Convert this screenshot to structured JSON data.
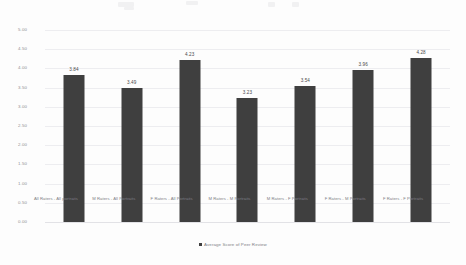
{
  "chart_data": {
    "type": "bar",
    "title": "",
    "xlabel": "",
    "ylabel": "",
    "ylim": [
      0,
      5
    ],
    "ytick_step": 0.5,
    "grid": true,
    "legend_position": "bottom",
    "bar_color": "#3f3f3f",
    "categories": [
      "All Raters - All portraits",
      "M Raters - All Portraits",
      "F Raters - All Portraits",
      "M Raters - M Portraits",
      "M Raters - F Portraits",
      "F Raters - M Portraits",
      "F Raters - F Portraits"
    ],
    "series": [
      {
        "name": "Average Score of Peer Review",
        "values": [
          3.84,
          3.49,
          4.23,
          3.23,
          3.54,
          3.96,
          4.28
        ]
      }
    ],
    "value_labels": [
      "3.84",
      "3.49",
      "4.23",
      "3.23",
      "3.54",
      "3.96",
      "4.28"
    ],
    "ytick_labels": [
      "5.00",
      "4.50",
      "4.00",
      "3.50",
      "3.00",
      "2.50",
      "2.00",
      "1.50",
      "1.00",
      "0.50",
      "0.00"
    ],
    "ytick_values": [
      5.0,
      4.5,
      4.0,
      3.5,
      3.0,
      2.5,
      2.0,
      1.5,
      1.0,
      0.5,
      0.0
    ]
  },
  "legend": {
    "entries": [
      {
        "label": "Average Score of Peer Review",
        "color": "#3f3f3f",
        "marker": "square-marker"
      }
    ]
  }
}
